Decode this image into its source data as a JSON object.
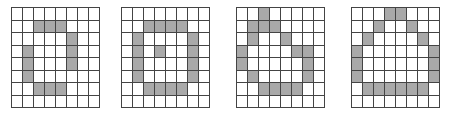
{
  "figure": {
    "grids": [
      {
        "id": "pattern-1",
        "left": 11,
        "rows": 8,
        "cols": 8,
        "filled": [
          [
            1,
            2
          ],
          [
            1,
            3
          ],
          [
            1,
            4
          ],
          [
            2,
            5
          ],
          [
            3,
            1
          ],
          [
            3,
            5
          ],
          [
            4,
            1
          ],
          [
            4,
            5
          ],
          [
            5,
            1
          ],
          [
            6,
            2
          ],
          [
            6,
            3
          ],
          [
            6,
            4
          ]
        ]
      },
      {
        "id": "pattern-2",
        "left": 121,
        "rows": 8,
        "cols": 8,
        "filled": [
          [
            1,
            2
          ],
          [
            1,
            3
          ],
          [
            1,
            4
          ],
          [
            1,
            5
          ],
          [
            2,
            1
          ],
          [
            2,
            6
          ],
          [
            3,
            1
          ],
          [
            3,
            3
          ],
          [
            3,
            6
          ],
          [
            4,
            1
          ],
          [
            4,
            6
          ],
          [
            5,
            1
          ],
          [
            5,
            6
          ],
          [
            6,
            2
          ],
          [
            6,
            3
          ],
          [
            6,
            4
          ],
          [
            6,
            5
          ]
        ]
      },
      {
        "id": "pattern-3",
        "left": 236,
        "rows": 8,
        "cols": 8,
        "filled": [
          [
            0,
            2
          ],
          [
            1,
            1
          ],
          [
            1,
            2
          ],
          [
            1,
            3
          ],
          [
            2,
            1
          ],
          [
            2,
            4
          ],
          [
            3,
            0
          ],
          [
            3,
            5
          ],
          [
            3,
            6
          ],
          [
            4,
            0
          ],
          [
            4,
            6
          ],
          [
            5,
            1
          ],
          [
            5,
            6
          ],
          [
            6,
            2
          ],
          [
            6,
            3
          ],
          [
            6,
            4
          ],
          [
            6,
            5
          ]
        ]
      },
      {
        "id": "pattern-4",
        "left": 351,
        "rows": 8,
        "cols": 8,
        "filled": [
          [
            0,
            3
          ],
          [
            0,
            4
          ],
          [
            1,
            2
          ],
          [
            1,
            5
          ],
          [
            2,
            1
          ],
          [
            2,
            6
          ],
          [
            3,
            0
          ],
          [
            3,
            7
          ],
          [
            4,
            0
          ],
          [
            4,
            7
          ],
          [
            5,
            0
          ],
          [
            5,
            7
          ],
          [
            6,
            1
          ],
          [
            6,
            2
          ],
          [
            6,
            3
          ],
          [
            6,
            4
          ],
          [
            6,
            5
          ],
          [
            6,
            6
          ]
        ]
      }
    ],
    "colors": {
      "filled": "#a9a9a9",
      "empty": "#ffffff",
      "gridline": "#444444"
    }
  }
}
